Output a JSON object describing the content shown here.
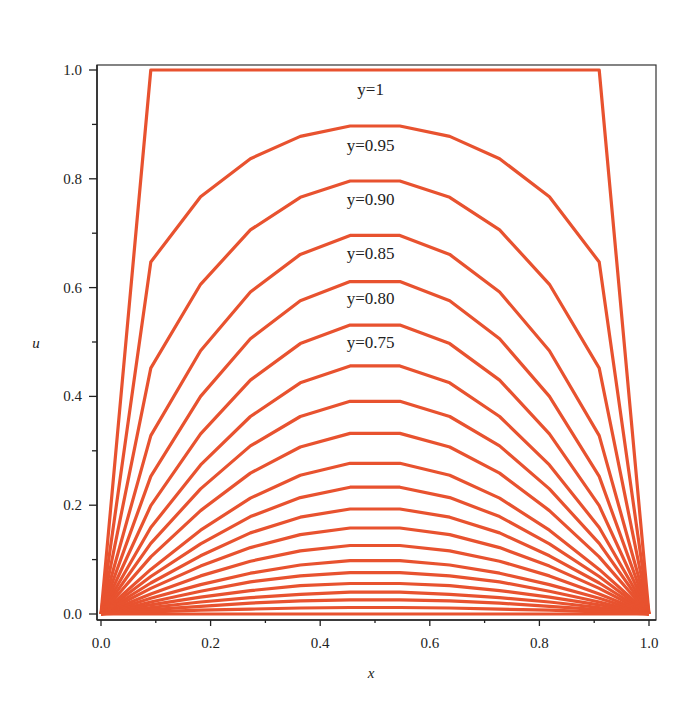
{
  "chart_data": {
    "type": "line",
    "title": "",
    "xlabel": "x",
    "ylabel": "u",
    "xlim": [
      0,
      1
    ],
    "ylim": [
      0,
      1
    ],
    "grid": false,
    "legend": "none",
    "line_color": "#e8522f",
    "x_ticks": [
      "0.0",
      "0.2",
      "0.4",
      "0.6",
      "0.8",
      "1.0"
    ],
    "y_ticks": [
      "0.0",
      "0.2",
      "0.4",
      "0.6",
      "0.8",
      "1.0"
    ],
    "x": [
      0,
      0.0909,
      0.1818,
      0.2727,
      0.3636,
      0.4545,
      0.5455,
      0.6364,
      0.7273,
      0.8182,
      0.9091,
      1.0
    ],
    "series": [
      {
        "name": "y=1",
        "values": [
          0,
          1,
          1,
          1,
          1,
          1,
          1,
          1,
          1,
          1,
          1,
          0
        ]
      },
      {
        "name": "y=0.95",
        "values": [
          0,
          0.647,
          0.767,
          0.837,
          0.878,
          0.897,
          0.897,
          0.878,
          0.837,
          0.767,
          0.647,
          0
        ]
      },
      {
        "name": "y=0.90",
        "values": [
          0,
          0.452,
          0.606,
          0.706,
          0.766,
          0.796,
          0.796,
          0.766,
          0.706,
          0.606,
          0.452,
          0
        ]
      },
      {
        "name": "y=0.85",
        "values": [
          0,
          0.328,
          0.484,
          0.592,
          0.661,
          0.696,
          0.696,
          0.661,
          0.592,
          0.484,
          0.328,
          0
        ]
      },
      {
        "name": "y=0.80",
        "values": [
          0,
          0.253,
          0.4,
          0.506,
          0.576,
          0.611,
          0.611,
          0.576,
          0.506,
          0.4,
          0.253,
          0
        ]
      },
      {
        "name": "y=0.75",
        "values": [
          0,
          0.199,
          0.331,
          0.43,
          0.497,
          0.531,
          0.531,
          0.497,
          0.43,
          0.331,
          0.199,
          0
        ]
      },
      {
        "name": "y=0.70",
        "values": [
          0,
          0.159,
          0.274,
          0.363,
          0.425,
          0.456,
          0.456,
          0.425,
          0.363,
          0.274,
          0.159,
          0
        ]
      },
      {
        "name": "y=0.65",
        "values": [
          0,
          0.13,
          0.23,
          0.309,
          0.363,
          0.391,
          0.391,
          0.363,
          0.309,
          0.23,
          0.13,
          0
        ]
      },
      {
        "name": "y=0.60",
        "values": [
          0,
          0.105,
          0.19,
          0.259,
          0.307,
          0.332,
          0.332,
          0.307,
          0.259,
          0.19,
          0.105,
          0
        ]
      },
      {
        "name": "y=0.55",
        "values": [
          0,
          0.082,
          0.154,
          0.213,
          0.255,
          0.277,
          0.277,
          0.255,
          0.213,
          0.154,
          0.082,
          0
        ]
      },
      {
        "name": "y=0.50",
        "values": [
          0,
          0.069,
          0.129,
          0.179,
          0.214,
          0.233,
          0.233,
          0.214,
          0.179,
          0.129,
          0.069,
          0
        ]
      },
      {
        "name": "y=0.45",
        "values": [
          0,
          0.057,
          0.107,
          0.149,
          0.178,
          0.193,
          0.193,
          0.178,
          0.149,
          0.107,
          0.057,
          0
        ]
      },
      {
        "name": "y=0.40",
        "values": [
          0,
          0.047,
          0.088,
          0.122,
          0.146,
          0.158,
          0.158,
          0.146,
          0.122,
          0.088,
          0.047,
          0
        ]
      },
      {
        "name": "y=0.35",
        "values": [
          0,
          0.037,
          0.07,
          0.097,
          0.116,
          0.126,
          0.126,
          0.116,
          0.097,
          0.07,
          0.037,
          0
        ]
      },
      {
        "name": "y=0.30",
        "values": [
          0,
          0.029,
          0.054,
          0.075,
          0.09,
          0.098,
          0.098,
          0.09,
          0.075,
          0.054,
          0.029,
          0
        ]
      },
      {
        "name": "y=0.25",
        "values": [
          0,
          0.022,
          0.042,
          0.059,
          0.07,
          0.076,
          0.076,
          0.07,
          0.059,
          0.042,
          0.022,
          0
        ]
      },
      {
        "name": "y=0.20",
        "values": [
          0,
          0.017,
          0.031,
          0.043,
          0.052,
          0.056,
          0.056,
          0.052,
          0.043,
          0.031,
          0.017,
          0
        ]
      },
      {
        "name": "y=0.15",
        "values": [
          0,
          0.012,
          0.022,
          0.03,
          0.036,
          0.04,
          0.04,
          0.036,
          0.03,
          0.022,
          0.012,
          0
        ]
      },
      {
        "name": "y=0.10",
        "values": [
          0,
          0.008,
          0.014,
          0.02,
          0.024,
          0.026,
          0.026,
          0.024,
          0.02,
          0.014,
          0.008,
          0
        ]
      },
      {
        "name": "y=0.05",
        "values": [
          0,
          0.004,
          0.007,
          0.009,
          0.011,
          0.012,
          0.012,
          0.011,
          0.009,
          0.007,
          0.004,
          0
        ]
      },
      {
        "name": "y=0",
        "values": [
          0,
          0,
          0,
          0,
          0,
          0,
          0,
          0,
          0,
          0,
          0,
          0
        ]
      }
    ],
    "annotations": [
      {
        "text": "y=1",
        "x": 0.492,
        "y": 0.965
      },
      {
        "text": "y=0.95",
        "x": 0.492,
        "y": 0.862
      },
      {
        "text": "y=0.90",
        "x": 0.492,
        "y": 0.762
      },
      {
        "text": "y=0.85",
        "x": 0.492,
        "y": 0.664
      },
      {
        "text": "y=0.80",
        "x": 0.492,
        "y": 0.58
      },
      {
        "text": "y=0.75",
        "x": 0.492,
        "y": 0.5
      }
    ]
  }
}
